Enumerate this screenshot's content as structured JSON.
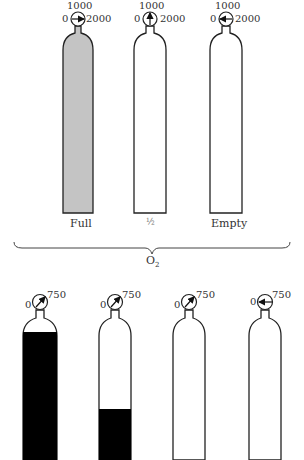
{
  "top_group": {
    "gas_label": "O",
    "gas_subscript": "2",
    "cylinders": [
      {
        "id": "full",
        "label": "Full",
        "gauge": {
          "min": "0",
          "mid": "1000",
          "max": "2000",
          "needle": "right"
        },
        "fill_level": 1.0,
        "fill_color": "#c4c4c4"
      },
      {
        "id": "half",
        "label": "½",
        "gauge": {
          "min": "0",
          "mid": "1000",
          "max": "2000",
          "needle": "up"
        },
        "fill_level": 0.0,
        "fill_color": "#ffffff"
      },
      {
        "id": "empty",
        "label": "Empty",
        "gauge": {
          "min": "0",
          "mid": "1000",
          "max": "2000",
          "needle": "left"
        },
        "fill_level": 0.0,
        "fill_color": "#ffffff"
      }
    ]
  },
  "bottom_group": {
    "cylinders": [
      {
        "id": "n2o-1",
        "gauge": {
          "min": "0",
          "max": "750",
          "needle": "up-right"
        },
        "liquid_level": "high",
        "fill_color": "#000000"
      },
      {
        "id": "n2o-2",
        "gauge": {
          "min": "0",
          "max": "750",
          "needle": "up-right"
        },
        "liquid_level": "low",
        "fill_color": "#000000"
      },
      {
        "id": "n2o-3",
        "gauge": {
          "min": "0",
          "max": "750",
          "needle": "up-right"
        },
        "liquid_level": "none",
        "fill_color": "#ffffff"
      },
      {
        "id": "n2o-4",
        "gauge": {
          "min": "0",
          "max": "750",
          "needle": "left"
        },
        "liquid_level": "none",
        "fill_color": "#ffffff"
      }
    ]
  }
}
